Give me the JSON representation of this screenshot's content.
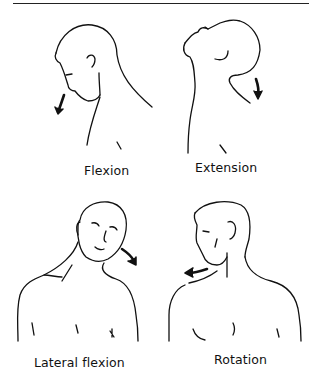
{
  "figure": {
    "panels": [
      {
        "id": "flexion",
        "label": "Flexion",
        "arrow_direction": "down-forward"
      },
      {
        "id": "extension",
        "label": "Extension",
        "arrow_direction": "down-backward"
      },
      {
        "id": "lateral-flexion",
        "label": "Lateral flexion",
        "arrow_direction": "down-right"
      },
      {
        "id": "rotation",
        "label": "Rotation",
        "arrow_direction": "left"
      }
    ],
    "colors": {
      "line": "#111111",
      "background": "#ffffff"
    }
  }
}
